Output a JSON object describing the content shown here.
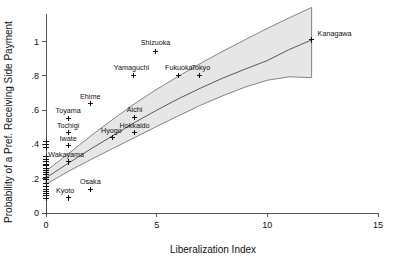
{
  "chart_data": {
    "type": "scatter",
    "title": "",
    "xlabel": "Liberalization Index",
    "ylabel": "Probability of a Pref. Receiving Side Payment",
    "xlim": [
      0,
      15
    ],
    "ylim": [
      0,
      1.15
    ],
    "xticks": [
      "0",
      "5",
      "10",
      "15"
    ],
    "xtick_values": [
      0,
      5,
      10,
      15
    ],
    "yticks": [
      "0",
      ".2",
      ".4",
      ".6",
      ".8",
      "1"
    ],
    "ytick_values": [
      0,
      0.2,
      0.4,
      0.6,
      0.8,
      1
    ],
    "grid": false,
    "legend": null,
    "points": [
      {
        "label": "Kanagawa",
        "x": 12.0,
        "y": 1.01,
        "label_dx": 6,
        "label_dy": -4,
        "anchor": "start"
      },
      {
        "label": "Shizuoka",
        "x": 4.95,
        "y": 0.945,
        "label_dx": 0,
        "label_dy": -6,
        "anchor": "middle"
      },
      {
        "label": "Tokyo",
        "x": 6.95,
        "y": 0.805,
        "label_dx": 1,
        "label_dy": -5,
        "anchor": "middle"
      },
      {
        "label": "Fukuoka",
        "x": 6.0,
        "y": 0.805,
        "label_dx": 0,
        "label_dy": -5,
        "anchor": "middle"
      },
      {
        "label": "Yamaguchi",
        "x": 3.95,
        "y": 0.805,
        "label_dx": -2,
        "label_dy": -5,
        "anchor": "middle"
      },
      {
        "label": "Ehime",
        "x": 2.0,
        "y": 0.638,
        "label_dx": 0,
        "label_dy": -5,
        "anchor": "middle"
      },
      {
        "label": "Aichi",
        "x": 4.0,
        "y": 0.558,
        "label_dx": 0,
        "label_dy": -5,
        "anchor": "middle"
      },
      {
        "label": "Toyama",
        "x": 1.0,
        "y": 0.553,
        "label_dx": 0,
        "label_dy": -5,
        "anchor": "middle"
      },
      {
        "label": "Tochigi",
        "x": 1.0,
        "y": 0.468,
        "label_dx": 0,
        "label_dy": -5,
        "anchor": "middle"
      },
      {
        "label": "Hokkaido",
        "x": 4.0,
        "y": 0.468,
        "label_dx": 0,
        "label_dy": -5,
        "anchor": "middle"
      },
      {
        "label": "Hyogo",
        "x": 3.0,
        "y": 0.443,
        "label_dx": -1,
        "label_dy": -4,
        "anchor": "middle"
      },
      {
        "label": "Iwate",
        "x": 1.0,
        "y": 0.392,
        "label_dx": 0,
        "label_dy": -5,
        "anchor": "middle"
      },
      {
        "label": "Wakayama",
        "x": 1.0,
        "y": 0.298,
        "label_dx": -2,
        "label_dy": -5,
        "anchor": "middle"
      },
      {
        "label": "Osaka",
        "x": 2.0,
        "y": 0.138,
        "label_dx": 0,
        "label_dy": -5,
        "anchor": "middle"
      },
      {
        "label": "Kyoto",
        "x": 1.0,
        "y": 0.088,
        "label_dx": -3,
        "label_dy": -5,
        "anchor": "middle"
      }
    ],
    "cluster_x": 0.0,
    "cluster_values": [
      0.415,
      0.4,
      0.385,
      0.33,
      0.315,
      0.3,
      0.285,
      0.275,
      0.262,
      0.248,
      0.235,
      0.222,
      0.208,
      0.195,
      0.172,
      0.155,
      0.14,
      0.128,
      0.115,
      0.1,
      0.085
    ],
    "fit_curve": [
      {
        "x": 0.0,
        "y": 0.205
      },
      {
        "x": 1.0,
        "y": 0.29
      },
      {
        "x": 2.0,
        "y": 0.372
      },
      {
        "x": 3.0,
        "y": 0.45
      },
      {
        "x": 4.0,
        "y": 0.528
      },
      {
        "x": 5.0,
        "y": 0.6
      },
      {
        "x": 6.0,
        "y": 0.668
      },
      {
        "x": 7.0,
        "y": 0.73
      },
      {
        "x": 8.0,
        "y": 0.788
      },
      {
        "x": 9.0,
        "y": 0.84
      },
      {
        "x": 10.0,
        "y": 0.89
      },
      {
        "x": 11.0,
        "y": 0.955
      },
      {
        "x": 12.0,
        "y": 1.01
      }
    ],
    "ci_upper": [
      {
        "x": 0.0,
        "y": 0.245
      },
      {
        "x": 1.0,
        "y": 0.345
      },
      {
        "x": 2.0,
        "y": 0.448
      },
      {
        "x": 3.0,
        "y": 0.545
      },
      {
        "x": 4.0,
        "y": 0.638
      },
      {
        "x": 5.0,
        "y": 0.722
      },
      {
        "x": 6.0,
        "y": 0.8
      },
      {
        "x": 7.0,
        "y": 0.875
      },
      {
        "x": 8.0,
        "y": 0.945
      },
      {
        "x": 9.0,
        "y": 1.012
      },
      {
        "x": 10.0,
        "y": 1.078
      },
      {
        "x": 11.0,
        "y": 1.14
      },
      {
        "x": 12.0,
        "y": 1.2
      }
    ],
    "ci_lower": [
      {
        "x": 0.0,
        "y": 0.168
      },
      {
        "x": 1.0,
        "y": 0.242
      },
      {
        "x": 2.0,
        "y": 0.31
      },
      {
        "x": 3.0,
        "y": 0.375
      },
      {
        "x": 4.0,
        "y": 0.44
      },
      {
        "x": 5.0,
        "y": 0.505
      },
      {
        "x": 6.0,
        "y": 0.568
      },
      {
        "x": 7.0,
        "y": 0.63
      },
      {
        "x": 8.0,
        "y": 0.685
      },
      {
        "x": 9.0,
        "y": 0.735
      },
      {
        "x": 10.0,
        "y": 0.775
      },
      {
        "x": 11.0,
        "y": 0.795
      },
      {
        "x": 12.0,
        "y": 0.79
      }
    ],
    "band_color": "#e6e6e6",
    "line_color": "#333333",
    "marker_color": "#111111",
    "marker_style": "plus"
  }
}
